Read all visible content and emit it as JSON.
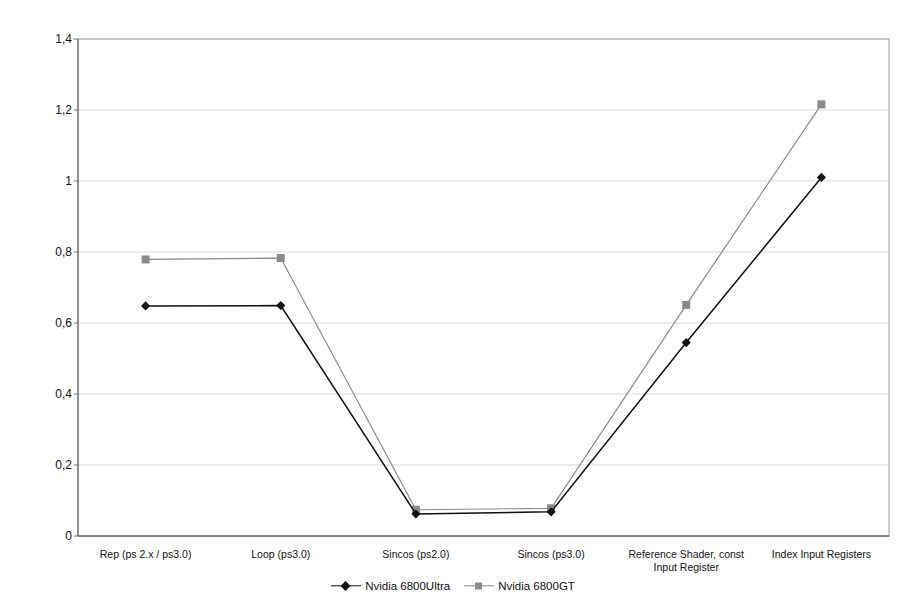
{
  "chart_data": {
    "type": "line",
    "title": "",
    "xlabel": "",
    "ylabel": "Time (in sec) for 1500 Quads (512x512)",
    "categories": [
      "Rep (ps 2.x / ps3.0)",
      "Loop (ps3.0)",
      "Sincos (ps2.0)",
      "Sincos (ps3.0)",
      "Reference Shader, const\nInput Register",
      "Index Input Registers"
    ],
    "series": [
      {
        "name": "Nvidia 6800Ultra",
        "color": "#111111",
        "marker": "diamond",
        "values": [
          0.648,
          0.649,
          0.062,
          0.068,
          0.545,
          1.01
        ]
      },
      {
        "name": "Nvidia 6800GT",
        "color": "#8a8a8a",
        "marker": "square",
        "values": [
          0.779,
          0.783,
          0.074,
          0.078,
          0.651,
          1.216
        ]
      }
    ],
    "ylim": [
      0,
      1.4
    ],
    "yticks": [
      0,
      0.2,
      0.4,
      0.6,
      0.8,
      1,
      1.2,
      1.4
    ],
    "ytick_labels": [
      "0",
      "0,2",
      "0,4",
      "0,6",
      "0,8",
      "1",
      "1,2",
      "1,4"
    ],
    "grid": true,
    "grid_color": "#d9d9d9",
    "legend_position": "bottom",
    "plot_bg": "#ffffff",
    "border_color": "#9a9a9a"
  },
  "legend": {
    "entries": [
      {
        "label": "Nvidia 6800Ultra"
      },
      {
        "label": "Nvidia 6800GT"
      }
    ]
  }
}
